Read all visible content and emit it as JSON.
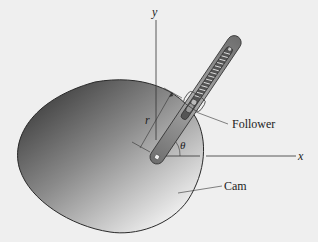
{
  "figure": {
    "labels": {
      "y_axis": "y",
      "x_axis": "x",
      "radius": "r",
      "angle": "θ",
      "follower": "Follower",
      "cam": "Cam"
    },
    "colors": {
      "background": "#efefef",
      "cam_dark": "#4a4a4a",
      "cam_light": "#e6e6e6",
      "follower_arm": "#8a8a8a",
      "axis": "#333333"
    }
  }
}
